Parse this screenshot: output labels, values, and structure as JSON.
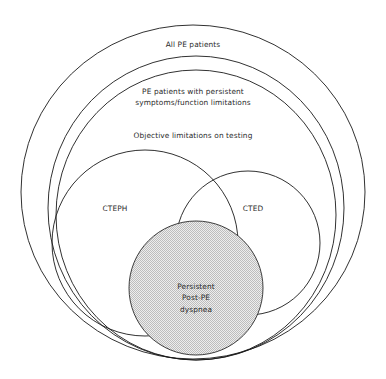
{
  "figure": {
    "background_color": "#ffffff",
    "stroke_color": "#1a1a1a",
    "text_color": "#2b2b2b",
    "shaded_fill_color": "#d8d8d8"
  },
  "labels": {
    "outer_ring": "All PE patients",
    "second_ring": "PE patients with persistent\nsymptoms/function limitations",
    "third_ring": "Objective limitations on testing",
    "left_lobe": "CTEPH",
    "right_lobe": "CTED",
    "core": "Persistent\nPost-PE\ndyspnea"
  },
  "chart_data": {
    "type": "diagram",
    "diagram_kind": "nested-venn",
    "title": "All PE patients",
    "sets": [
      {
        "name": "All PE patients",
        "label": "All PE patients",
        "shape": "ellipse",
        "cx": 193,
        "cy": 192,
        "rx": 172,
        "ry": 167,
        "fill": "none",
        "nesting_level": 1
      },
      {
        "name": "PE patients with persistent symptoms/function limitations",
        "label": "PE patients with persistent symptoms/function limitations",
        "shape": "ellipse",
        "cx": 196,
        "cy": 208,
        "rx": 148,
        "ry": 152,
        "fill": "none",
        "nesting_level": 2
      },
      {
        "name": "Objective limitations on testing",
        "label": "Objective limitations on testing",
        "shape": "ellipse",
        "cx": 196,
        "cy": 215,
        "rx": 140,
        "ry": 145,
        "fill": "none",
        "nesting_level": 3
      },
      {
        "name": "CTEPH",
        "label": "CTEPH",
        "shape": "circle",
        "cx": 145,
        "cy": 243,
        "r": 93,
        "fill": "none",
        "nesting_level": 4
      },
      {
        "name": "CTED",
        "label": "CTED",
        "shape": "circle",
        "cx": 248,
        "cy": 243,
        "r": 72,
        "fill": "none",
        "nesting_level": 4
      },
      {
        "name": "Persistent Post-PE dyspnea",
        "label": "Persistent Post-PE dyspnea",
        "shape": "circle",
        "cx": 196,
        "cy": 288,
        "r": 67,
        "fill": "#d8d8d8",
        "fill_pattern": "fine-checkerboard-dither",
        "nesting_level": 5
      }
    ],
    "relationships": [
      "CTEPH and CTED overlap",
      "CTEPH and CTED are inside 'Objective limitations on testing'",
      "'Objective limitations on testing' is inside 'PE patients with persistent symptoms/function limitations'",
      "'PE patients with persistent symptoms/function limitations' is inside 'All PE patients'",
      "'Persistent Post-PE dyspnea' spans the lower portion of CTEPH, CTED and all nested rings"
    ],
    "legend": null,
    "grid": false
  }
}
